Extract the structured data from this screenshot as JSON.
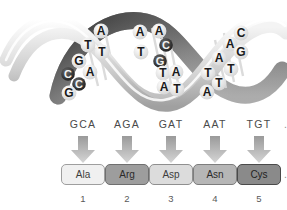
{
  "figure": {
    "background": "#ffffff"
  },
  "helix": {
    "name": "dna-double-helix",
    "description": "Grayscale DNA double helix ribbon illustration with paired nucleotide bases",
    "ribbon_light": "#e8e8e8",
    "ribbon_mid": "#b4b4b4",
    "ribbon_dark": "#4f4f4f",
    "bases": [
      {
        "letter": "A",
        "x": 101,
        "y": 31,
        "size": 12,
        "color": "#1a1a1a",
        "disc": "light"
      },
      {
        "letter": "T",
        "x": 88,
        "y": 45,
        "size": 12,
        "color": "#1a1a1a",
        "disc": "light"
      },
      {
        "letter": "T",
        "x": 102,
        "y": 52,
        "size": 12,
        "color": "#1a1a1a",
        "disc": "light"
      },
      {
        "letter": "G",
        "x": 79,
        "y": 61,
        "size": 12,
        "color": "#1a1a1a",
        "disc": "light"
      },
      {
        "letter": "A",
        "x": 90,
        "y": 72,
        "size": 12,
        "color": "#1a1a1a",
        "disc": "light"
      },
      {
        "letter": "C",
        "x": 68,
        "y": 74,
        "size": 11,
        "color": "#f2f2f2",
        "disc": "dark"
      },
      {
        "letter": "C",
        "x": 79,
        "y": 84,
        "size": 11,
        "color": "#f2f2f2",
        "disc": "dark"
      },
      {
        "letter": "G",
        "x": 69,
        "y": 93,
        "size": 12,
        "color": "#1a1a1a",
        "disc": "light"
      },
      {
        "letter": "A",
        "x": 140,
        "y": 32,
        "size": 12,
        "color": "#1a1a1a",
        "disc": "light"
      },
      {
        "letter": "A",
        "x": 159,
        "y": 31,
        "size": 12,
        "color": "#1a1a1a",
        "disc": "light"
      },
      {
        "letter": "C",
        "x": 166,
        "y": 45,
        "size": 11,
        "color": "#f2f2f2",
        "disc": "dark"
      },
      {
        "letter": "T",
        "x": 141,
        "y": 52,
        "size": 12,
        "color": "#1a1a1a",
        "disc": "light"
      },
      {
        "letter": "G",
        "x": 160,
        "y": 61,
        "size": 11,
        "color": "#f2f2f2",
        "disc": "dark"
      },
      {
        "letter": "T",
        "x": 163,
        "y": 73,
        "size": 12,
        "color": "#1a1a1a",
        "disc": "light"
      },
      {
        "letter": "A",
        "x": 176,
        "y": 72,
        "size": 12,
        "color": "#1a1a1a",
        "disc": "light"
      },
      {
        "letter": "A",
        "x": 164,
        "y": 87,
        "size": 12,
        "color": "#1a1a1a",
        "disc": "light"
      },
      {
        "letter": "T",
        "x": 177,
        "y": 89,
        "size": 12,
        "color": "#1a1a1a",
        "disc": "light"
      },
      {
        "letter": "C",
        "x": 241,
        "y": 33,
        "size": 12,
        "color": "#1a1a1a",
        "disc": "light"
      },
      {
        "letter": "A",
        "x": 230,
        "y": 44,
        "size": 12,
        "color": "#1a1a1a",
        "disc": "light"
      },
      {
        "letter": "G",
        "x": 241,
        "y": 52,
        "size": 12,
        "color": "#1a1a1a",
        "disc": "light"
      },
      {
        "letter": "A",
        "x": 219,
        "y": 58,
        "size": 12,
        "color": "#1a1a1a",
        "disc": "light"
      },
      {
        "letter": "T",
        "x": 231,
        "y": 69,
        "size": 12,
        "color": "#1a1a1a",
        "disc": "light"
      },
      {
        "letter": "T",
        "x": 208,
        "y": 73,
        "size": 12,
        "color": "#1a1a1a",
        "disc": "light"
      },
      {
        "letter": "T",
        "x": 219,
        "y": 83,
        "size": 12,
        "color": "#1a1a1a",
        "disc": "light"
      },
      {
        "letter": "A",
        "x": 207,
        "y": 92,
        "size": 12,
        "color": "#1a1a1a",
        "disc": "light"
      }
    ]
  },
  "translation": {
    "name": "codon-to-amino-acid-translation",
    "arrow_color_top": "#9a9a9a",
    "arrow_color_bottom": "#d5d5d5",
    "codon_trailing_ellipsis": "...",
    "chain_trailing_ellipsis": "...",
    "columns": [
      {
        "codon": "GCA",
        "amino_acid": "Ala",
        "number": "1",
        "box_fill": "#f0f0f0",
        "box_border": "#9e9e9e",
        "text_color": "#3d3d3d",
        "x": 60
      },
      {
        "codon": "AGA",
        "amino_acid": "Arg",
        "number": "2",
        "box_fill": "#9d9d9d",
        "box_border": "#6f6f6f",
        "text_color": "#2b2b2b",
        "x": 104
      },
      {
        "codon": "GAT",
        "amino_acid": "Asp",
        "number": "3",
        "box_fill": "#dcdcdc",
        "box_border": "#8f8f8f",
        "text_color": "#3d3d3d",
        "x": 148
      },
      {
        "codon": "AAT",
        "amino_acid": "Asn",
        "number": "4",
        "box_fill": "#b6b6b6",
        "box_border": "#7d7d7d",
        "text_color": "#2b2b2b",
        "x": 192
      },
      {
        "codon": "TGT",
        "amino_acid": "Cys",
        "number": "5",
        "box_fill": "#8a8a8a",
        "box_border": "#4a4a4a",
        "text_color": "#1f1f1f",
        "x": 236
      }
    ]
  }
}
